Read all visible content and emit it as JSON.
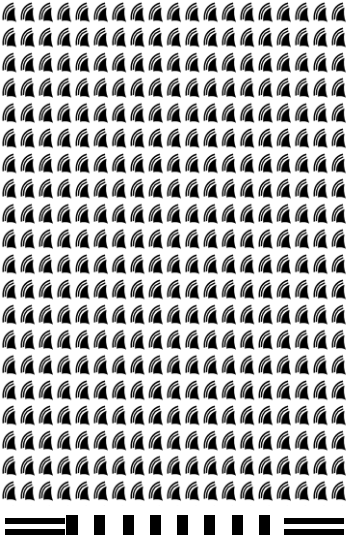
{
  "image": {
    "description": "Repeating grid of black crescent/fin motifs with concentric arcs, above a strip of horizontal and vertical black bars",
    "colors": {
      "background": "#ffffff",
      "ink": "#000000"
    },
    "pattern": {
      "motif": "fin-with-arcs",
      "columns": 19,
      "rows": 20,
      "tile_width": 18.3,
      "tile_height": 25.2
    },
    "bottom_strip": {
      "left_hbars": 2,
      "vbars": 7,
      "right_hbars": 2
    }
  }
}
